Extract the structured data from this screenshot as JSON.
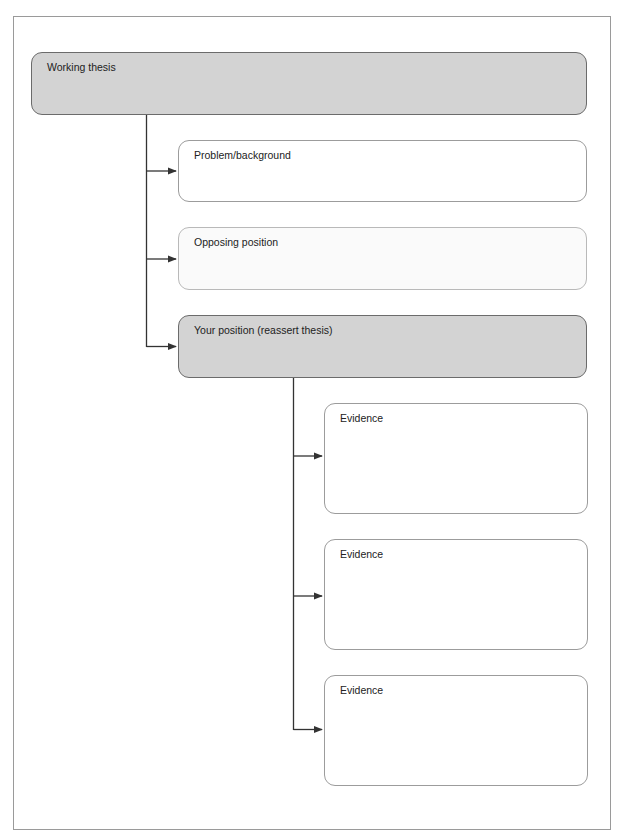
{
  "diagram": {
    "root": {
      "label": "Working thesis",
      "style": "dark"
    },
    "level1": [
      {
        "label": "Problem/background",
        "style": "white"
      },
      {
        "label": "Opposing position",
        "style": "light"
      },
      {
        "label": "Your position (reassert thesis)",
        "style": "dark"
      }
    ],
    "level2": [
      {
        "label": "Evidence",
        "style": "white"
      },
      {
        "label": "Evidence",
        "style": "white"
      },
      {
        "label": "Evidence",
        "style": "white"
      }
    ],
    "colors": {
      "dark_fill": "#d3d3d3",
      "dark_border": "#6b6b6b",
      "light_fill": "#fafafa",
      "white_border": "#9c9c9c",
      "connector": "#333333",
      "frame_border": "#9a9a9a"
    }
  }
}
